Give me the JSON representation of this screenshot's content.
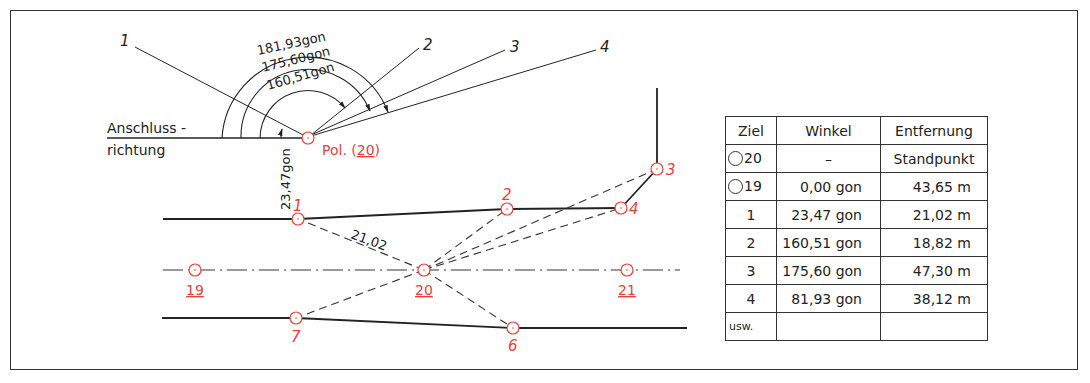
{
  "colors": {
    "ink": "#222222",
    "point": "#e8413c",
    "frame": "#333333"
  },
  "diagram": {
    "reference_label_line1": "Anschluss -",
    "reference_label_line2": "richtung",
    "pol_label": "Pol. (",
    "pol_number": "20",
    "pol_suffix": ")",
    "angle_labels": {
      "outer": "181,93gon",
      "middle": "175,60gon",
      "inner": "160,51gon",
      "vertical": "23,47gon"
    },
    "ray_labels": [
      "1",
      "2",
      "3",
      "4"
    ],
    "distance_label": "21,02",
    "points": [
      {
        "id": "1",
        "underlined": false
      },
      {
        "id": "2",
        "underlined": false
      },
      {
        "id": "3",
        "underlined": false
      },
      {
        "id": "4",
        "underlined": false
      },
      {
        "id": "6",
        "underlined": false
      },
      {
        "id": "7",
        "underlined": false
      },
      {
        "id": "19",
        "underlined": true
      },
      {
        "id": "20",
        "underlined": true
      },
      {
        "id": "21",
        "underlined": true
      }
    ]
  },
  "table": {
    "headers": {
      "ziel": "Ziel",
      "winkel": "Winkel",
      "entfernung": "Entfernung"
    },
    "rows": [
      {
        "ziel": "20",
        "ring": true,
        "winkel": "–",
        "entfernung": "Standpunkt"
      },
      {
        "ziel": "19",
        "ring": true,
        "winkel": "0,00 gon",
        "entfernung": "43,65  m"
      },
      {
        "ziel": "1",
        "ring": false,
        "winkel": "23,47 gon",
        "entfernung": "21,02  m"
      },
      {
        "ziel": "2",
        "ring": false,
        "winkel": "160,51 gon",
        "entfernung": "18,82  m"
      },
      {
        "ziel": "3",
        "ring": false,
        "winkel": "175,60 gon",
        "entfernung": "47,30  m"
      },
      {
        "ziel": "4",
        "ring": false,
        "winkel": "81,93 gon",
        "entfernung": "38,12  m"
      },
      {
        "ziel": "usw.",
        "ring": false,
        "winkel": "",
        "entfernung": ""
      }
    ]
  }
}
